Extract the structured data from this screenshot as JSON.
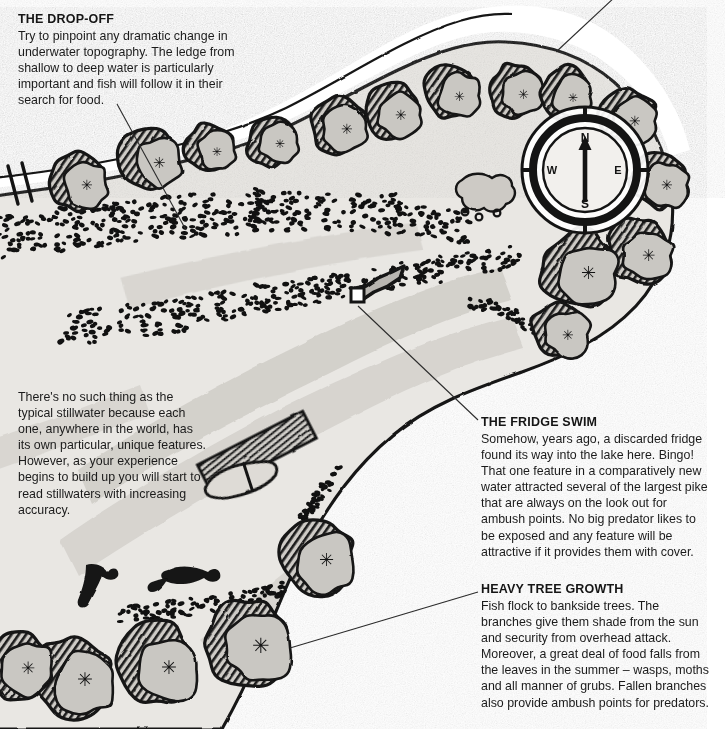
{
  "figure": {
    "kind": "hand-drawn stillwater lake map with annotations",
    "paper_color": "#ffffff",
    "ink_color": "#141414",
    "water_fill": "#e9e7e3",
    "deep_water_fill": "#cfccc7",
    "tree_canopy_fill": "#c9c7c2",
    "bank_fill": "#d9d7d2"
  },
  "callouts": [
    {
      "id": "drop-off",
      "title": "THE DROP-OFF",
      "body": "Try to pinpoint any dramatic change in underwater topography. The ledge from shallow to deep water is particularly important and fish will follow it in their search for food."
    },
    {
      "id": "fridge-swim",
      "title": "THE FRIDGE SWIM",
      "body": "Somehow, years ago, a discarded fridge found its way into the lake here. Bingo! That one feature in a comparatively new water attracted several of the largest pike that are always on the look out for ambush points. No big predator likes to be exposed and any feature will be attractive if it provides them with cover."
    },
    {
      "id": "heavy-tree-growth",
      "title": "HEAVY TREE GROWTH",
      "body": "Fish flock to bankside trees. The branches give them shade from the sun and security from overhead attack. Moreover, a great deal of food falls from the leaves in the summer – wasps, moths and all manner of grubs. Fallen branches also provide ambush points for predators."
    }
  ],
  "note": {
    "id": "stillwater-note",
    "body": "There's no such thing as the typical stillwater because each one, anywhere in the world, has its own particular, unique features. However, as your experience begins to build up you will start to read stillwaters with increasing accuracy."
  },
  "compass": {
    "north": "N",
    "east": "E",
    "south": "S",
    "west": "W",
    "needle_points": "N"
  },
  "map_features": {
    "lake_label": "stillwater lake body",
    "shallow_margin": "stippled shallow margin",
    "drop_off_ledge": "depth ledge bands",
    "fridge": "discarded fridge on lake bed",
    "jetty": "wooden jetty / landing stage",
    "boat": "moored rowing boat",
    "fallen_branches": "fallen branches on bank",
    "weed_patch": "small weed patch",
    "bank_path": "path marks on west bank",
    "trees_count": 17
  }
}
